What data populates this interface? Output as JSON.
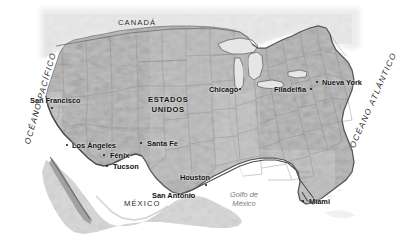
{
  "map": {
    "title": "Mapa de Estados Unidos",
    "projection_note": "",
    "background_color": "#ffffff",
    "land_color": "#b9b9b9",
    "coast_color": "#5d5d5d",
    "border_color": "#8f8f8f",
    "label_color": "#111111",
    "sea_label_color": "#7d7d7d"
  },
  "countries": [
    {
      "name": "CANADÁ",
      "x": 118,
      "y": 19,
      "style": "plain"
    },
    {
      "name": "ESTADOS",
      "name2": "UNIDOS",
      "x": 148,
      "y": 96,
      "style": "bold"
    },
    {
      "name": "MÉXICO",
      "x": 124,
      "y": 200,
      "style": "plain"
    }
  ],
  "oceans": [
    {
      "name": "OCÉANO PACÍFICO",
      "x": 24,
      "y": 143,
      "rotation": -74
    },
    {
      "name": "OCÉANO ATLÁNTICO",
      "x": 349,
      "y": 146,
      "rotation": -66
    }
  ],
  "seas": [
    {
      "name": "Golfo de",
      "name2": "México",
      "x": 230,
      "y": 190
    }
  ],
  "cities": [
    {
      "name": "San Francisco",
      "label_x": 30,
      "label_y": 97,
      "dot_x": 51,
      "dot_y": 107,
      "anchor": "below"
    },
    {
      "name": "Los Ángeles",
      "label_x": 72,
      "label_y": 142,
      "dot_x": 66,
      "dot_y": 144,
      "anchor": "left"
    },
    {
      "name": "Fénix",
      "label_x": 110,
      "label_y": 152,
      "dot_x": 103,
      "dot_y": 154,
      "anchor": "left"
    },
    {
      "name": "Tucson",
      "label_x": 113,
      "label_y": 163,
      "dot_x": 106,
      "dot_y": 165,
      "anchor": "left"
    },
    {
      "name": "Santa Fe",
      "label_x": 147,
      "label_y": 140,
      "dot_x": 140,
      "dot_y": 142,
      "anchor": "left"
    },
    {
      "name": "Houston",
      "label_x": 180,
      "label_y": 174,
      "dot_x": 205,
      "dot_y": 184,
      "anchor": "below"
    },
    {
      "name": "San Antonio",
      "label_x": 152,
      "label_y": 192,
      "dot_x": 190,
      "dot_y": 194,
      "anchor": "right"
    },
    {
      "name": "Chicago",
      "label_x": 209,
      "label_y": 86,
      "dot_x": 239,
      "dot_y": 88,
      "anchor": "right"
    },
    {
      "name": "Filadelfia",
      "label_x": 274,
      "label_y": 86,
      "dot_x": 310,
      "dot_y": 88,
      "anchor": "right"
    },
    {
      "name": "Nueva York",
      "label_x": 322,
      "label_y": 79,
      "dot_x": 316,
      "dot_y": 81,
      "anchor": "left"
    },
    {
      "name": "Miami",
      "label_x": 309,
      "label_y": 198,
      "dot_x": 302,
      "dot_y": 200,
      "anchor": "left"
    }
  ]
}
